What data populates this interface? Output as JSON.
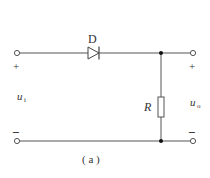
{
  "diagram": {
    "type": "circuit",
    "caption": "( a )",
    "components": {
      "diode": {
        "label": "D"
      },
      "resistor": {
        "label": "R"
      }
    },
    "input": {
      "label_main": "u",
      "label_sub": "i",
      "plus": "+",
      "minus": "−"
    },
    "output": {
      "label_main": "u",
      "label_sub": "o",
      "plus": "+",
      "minus": "−"
    },
    "colors": {
      "wire": "#555555",
      "text": "#333333",
      "background": "#ffffff"
    }
  }
}
